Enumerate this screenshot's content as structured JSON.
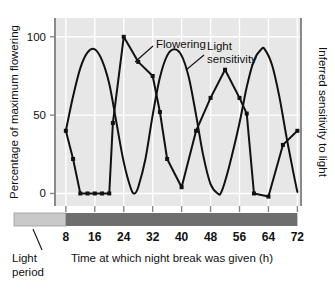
{
  "figure": {
    "background": "#ffffff",
    "plot_background": "#e7e7e7",
    "gridline_color": "#ffffff",
    "axis_color": "#888888",
    "line_color": "#111111"
  },
  "axes": {
    "y_left_label": "Percentage of maximum flowering",
    "y_right_label": "Inferred sensitivity to light",
    "x_label": "Time at which night break was given (h)",
    "y_ticks": [
      "0",
      "50",
      "100"
    ],
    "x_ticks": [
      "8",
      "16",
      "24",
      "32",
      "40",
      "48",
      "56",
      "64",
      "72"
    ]
  },
  "annotations": {
    "flowering_label": "Flowering",
    "light_sensitivity_label_line1": "Light",
    "light_sensitivity_label_line2": "sensitivity",
    "light_period_label_line1": "Light",
    "light_period_label_line2": "period"
  },
  "light_bar": {
    "light_segment_color": "#c9c9c9",
    "dark_segment_color": "#6e6e6e",
    "light_segment_end_hour": 8,
    "dark_segment_end_hour": 72
  },
  "chart_data": {
    "type": "line",
    "title": "",
    "xlabel": "Time at which night break was given (h)",
    "ylabel": "Percentage of maximum flowering",
    "y2label": "Inferred sensitivity to light",
    "xlim": [
      5,
      73
    ],
    "ylim": [
      -8,
      112
    ],
    "xticks": [
      8,
      16,
      24,
      32,
      40,
      48,
      56,
      64,
      72
    ],
    "yticks": [
      0,
      50,
      100
    ],
    "grid": true,
    "legend": "inline-annotations",
    "series": [
      {
        "name": "Flowering",
        "style": "polyline-with-square-markers",
        "points": [
          [
            8,
            40
          ],
          [
            10,
            22
          ],
          [
            12,
            0
          ],
          [
            14,
            0
          ],
          [
            16,
            0
          ],
          [
            18,
            0
          ],
          [
            20,
            0
          ],
          [
            21,
            45
          ],
          [
            24,
            100
          ],
          [
            28,
            84
          ],
          [
            32,
            75
          ],
          [
            34,
            52
          ],
          [
            36,
            22
          ],
          [
            40,
            4
          ],
          [
            44,
            40
          ],
          [
            48,
            61
          ],
          [
            52,
            79
          ],
          [
            56,
            61
          ],
          [
            58,
            51
          ],
          [
            60,
            0
          ],
          [
            64,
            -2
          ],
          [
            68,
            31
          ],
          [
            72,
            40
          ]
        ]
      },
      {
        "name": "Light sensitivity",
        "style": "smooth-sinusoidal-curve",
        "period_hours": 24,
        "points": [
          [
            8,
            40
          ],
          [
            10,
            62
          ],
          [
            12,
            80
          ],
          [
            14,
            90
          ],
          [
            16,
            92
          ],
          [
            18,
            85
          ],
          [
            20,
            70
          ],
          [
            22,
            45
          ],
          [
            24,
            20
          ],
          [
            26,
            3
          ],
          [
            27,
            0
          ],
          [
            28,
            4
          ],
          [
            30,
            22
          ],
          [
            32,
            50
          ],
          [
            34,
            74
          ],
          [
            36,
            88
          ],
          [
            38,
            92
          ],
          [
            40,
            88
          ],
          [
            42,
            74
          ],
          [
            44,
            50
          ],
          [
            46,
            24
          ],
          [
            48,
            6
          ],
          [
            50,
            0
          ],
          [
            51,
            1
          ],
          [
            53,
            16
          ],
          [
            56,
            45
          ],
          [
            58,
            68
          ],
          [
            60,
            85
          ],
          [
            62,
            92
          ],
          [
            63,
            92
          ],
          [
            65,
            82
          ],
          [
            67,
            62
          ],
          [
            69,
            36
          ],
          [
            71,
            12
          ],
          [
            72,
            1
          ]
        ]
      }
    ]
  }
}
